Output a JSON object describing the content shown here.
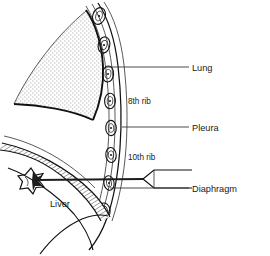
{
  "figure": {
    "kind": "anatomical-line-drawing",
    "background_color": "#ffffff",
    "ink_color": "#111111"
  },
  "labels": [
    {
      "id": "lung",
      "text": "Lung",
      "x": 192,
      "y": 71,
      "leader": {
        "x1": 106,
        "y1": 67,
        "x2": 189,
        "y2": 67
      },
      "anchor": "start"
    },
    {
      "id": "eighth-rib",
      "text": "8th rib",
      "x": 128,
      "y": 104,
      "leader": null,
      "anchor": "start"
    },
    {
      "id": "pleura",
      "text": "Pleura",
      "x": 192,
      "y": 131,
      "leader": {
        "x1": 122,
        "y1": 127,
        "x2": 189,
        "y2": 127
      },
      "anchor": "start"
    },
    {
      "id": "tenth-rib",
      "text": "10th rib",
      "x": 128,
      "y": 160,
      "leader": null,
      "anchor": "start"
    },
    {
      "id": "liver",
      "text": "Liver",
      "x": 50,
      "y": 207,
      "leader": null,
      "anchor": "start"
    },
    {
      "id": "diaphragm",
      "text": "Diaphragm",
      "x": 192,
      "y": 192,
      "leader": {
        "x1": 110,
        "y1": 188,
        "x2": 189,
        "y2": 188
      },
      "anchor": "start"
    }
  ],
  "structures": {
    "lung": {
      "name": "Lung",
      "fill_style": "stipple",
      "stipple_color": "#5a5a5a",
      "note": "Triangular wedge with dotted (stippled) interior, apex upper right"
    },
    "chest_wall": {
      "name": "Chest wall with ribs",
      "rib_count_drawn": 8,
      "rib_shape": "oval cross-sections",
      "note": "Curved vertical band of rib cross-sections descending on the right"
    },
    "pleura": {
      "name": "Pleura",
      "note": "Thin line following the inner chest wall"
    },
    "diaphragm": {
      "name": "Diaphragm",
      "fill_style": "cross-hatch",
      "note": "Hatched curved band sweeping from left down to costophrenic recess"
    },
    "liver": {
      "name": "Liver",
      "note": "Soft outline below diaphragm, left of center"
    },
    "lesion": {
      "name": "Target lesion",
      "shape": "star-burst",
      "x": 32,
      "y": 180,
      "note": "Irregular stellate lesion at the needle tip"
    },
    "needle": {
      "name": "Biopsy needle",
      "hub_x": 143,
      "hub_y": 179,
      "tip_x": 36,
      "tip_y": 180,
      "note": "Straight shaft from hub at right passing between 10th rib and diaphragm into the lesion"
    }
  }
}
